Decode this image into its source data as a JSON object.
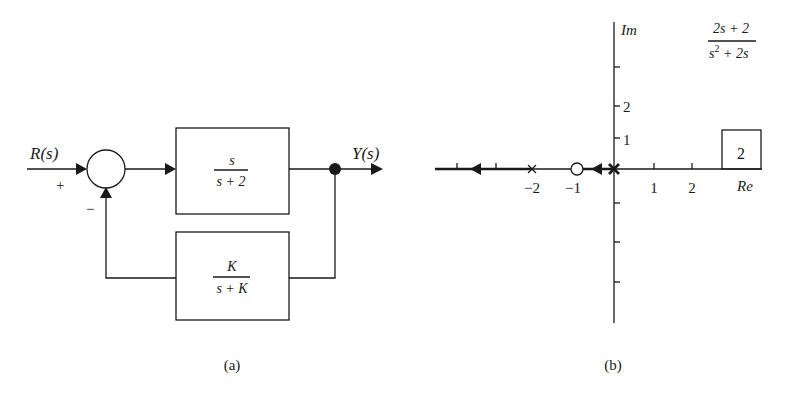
{
  "figure_a": {
    "caption": "(a)",
    "input_label": "R(s)",
    "output_label": "Y(s)",
    "summing_junction": {
      "plus_sign": "+",
      "minus_sign": "−"
    },
    "forward_block": {
      "numerator": "s",
      "denominator": "s + 2"
    },
    "feedback_block": {
      "numerator": "K",
      "denominator": "s + K"
    }
  },
  "figure_b": {
    "caption": "(b)",
    "imag_axis_label": "Im",
    "real_axis_label": "Re",
    "real_tick_labels": [
      "−2",
      "−1",
      "1",
      "2"
    ],
    "imag_tick_labels": [
      "1",
      "2"
    ],
    "transfer_function": {
      "numerator": "2s + 2",
      "denominator_base": "s",
      "denominator_exp": "2",
      "denominator_rest": " + 2s"
    },
    "case_box_label": "2",
    "poles": [
      0,
      -2
    ],
    "zeros": [
      -1
    ]
  }
}
